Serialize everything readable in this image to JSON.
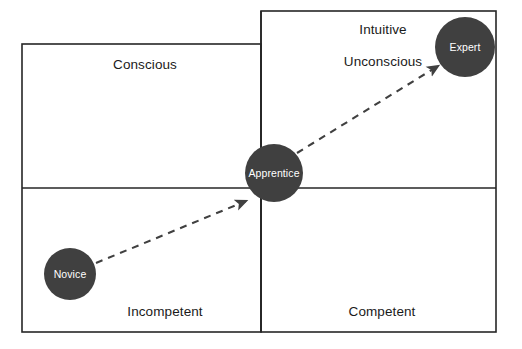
{
  "diagram": {
    "type": "quadrant-matrix",
    "title": "",
    "colors": {
      "node_fill": "#404040",
      "node_label": "#ffffff",
      "frame_stroke": "#262626",
      "arrow_stroke": "#404040",
      "background": "#ffffff",
      "quadrant_label": "#1a1a1a"
    },
    "frame": {
      "left_box": {
        "x": 22,
        "y": 44,
        "width": 239,
        "height": 288
      },
      "right_box": {
        "x": 261,
        "y": 11,
        "width": 235,
        "height": 321
      },
      "vertical_divider_x": 261,
      "horizontal_divider_y": 188,
      "stroke_width": 1.6
    },
    "axis_labels": [
      {
        "id": "conscious",
        "text": "Conscious",
        "x": 145,
        "y": 64
      },
      {
        "id": "intuitive",
        "text": "Intuitive",
        "x": 383,
        "y": 29
      },
      {
        "id": "unconscious",
        "text": "Unconscious",
        "x": 383,
        "y": 61
      },
      {
        "id": "incompetent",
        "text": "Incompetent",
        "x": 165,
        "y": 311
      },
      {
        "id": "competent",
        "text": "Competent",
        "x": 382,
        "y": 311
      }
    ],
    "nodes": [
      {
        "id": "novice",
        "label": "Novice",
        "cx": 70,
        "cy": 274,
        "r": 26
      },
      {
        "id": "apprentice",
        "label": "Apprentice",
        "cx": 274,
        "cy": 173,
        "r": 29
      },
      {
        "id": "expert",
        "label": "Expert",
        "cx": 465,
        "cy": 47,
        "r": 30
      }
    ],
    "arrows": [
      {
        "id": "novice-to-apprentice",
        "from": "novice",
        "to": "apprentice",
        "x1": 96,
        "y1": 263,
        "x2": 246,
        "y2": 201,
        "dash": "7 6"
      },
      {
        "id": "apprentice-to-expert",
        "from": "apprentice",
        "to": "expert",
        "x1": 297,
        "y1": 153,
        "x2": 438,
        "y2": 66,
        "dash": "7 6"
      }
    ]
  }
}
